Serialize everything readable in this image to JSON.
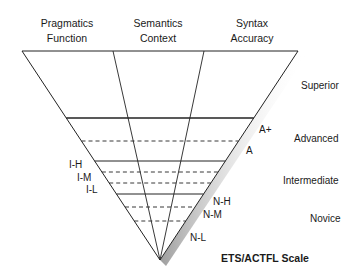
{
  "diagram": {
    "type": "inverted-triangle",
    "columns": [
      {
        "line1": "Pragmatics",
        "line2": "Function"
      },
      {
        "line1": "Semantics",
        "line2": "Context"
      },
      {
        "line1": "Syntax",
        "line2": "Accuracy"
      }
    ],
    "levels": [
      {
        "name": "Superior"
      },
      {
        "name": "Advanced",
        "sublevels": [
          "A+",
          "A"
        ]
      },
      {
        "name": "Intermediate",
        "sublevels": [
          "I-H",
          "I-M",
          "I-L"
        ]
      },
      {
        "name": "Novice",
        "sublevels": [
          "N-H",
          "N-M",
          "N-L"
        ]
      }
    ],
    "scale_title": "ETS/ACTFL Scale",
    "colors": {
      "line": "#222222",
      "shadow": "#9a9a9a",
      "text": "#1a1a1a"
    }
  }
}
